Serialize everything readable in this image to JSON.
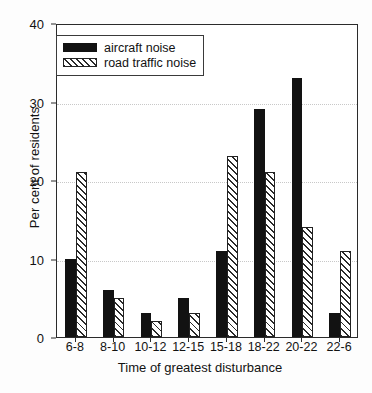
{
  "chart_data": {
    "type": "bar",
    "title": "",
    "subtitle": "",
    "xlabel": "Time of greatest disturbance",
    "ylabel": "Per cent of residents",
    "categories": [
      "6-8",
      "8-10",
      "10-12",
      "12-15",
      "15-18",
      "18-22",
      "20-22",
      "22-6"
    ],
    "series": [
      {
        "name": "aircraft noise",
        "values": [
          10,
          6,
          3,
          5,
          11,
          29,
          33,
          3
        ],
        "fill": "solid",
        "color": "#121212"
      },
      {
        "name": "road traffic noise",
        "values": [
          21,
          5,
          2,
          3,
          23,
          21,
          14,
          11
        ],
        "fill": "diagonal-hatch",
        "color": "#ffffff"
      }
    ],
    "ylim": [
      0,
      40
    ],
    "yticks": [
      0,
      10,
      20,
      30,
      40
    ],
    "ytick_labels": [
      "0",
      "10",
      "20",
      "30",
      "40"
    ],
    "grid": "horizontal-dotted",
    "legend_position": "upper-left-inside",
    "axis_color": "#2b2b2b",
    "grid_color": "#c8c8c8",
    "background": "#ffffff"
  }
}
